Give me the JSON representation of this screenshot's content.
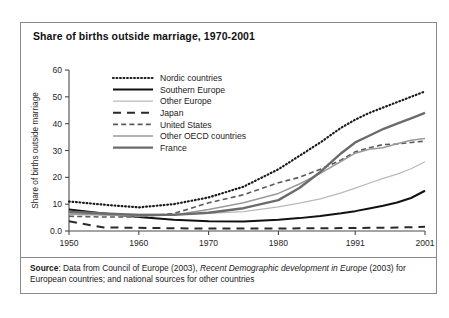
{
  "figure": {
    "title": "Share of births outside marriage, 1970-2001",
    "source_prefix": "Source",
    "source_text_1": ": Data from Council of Europe (2003), ",
    "source_italic": "Recent Demographic development in Europe",
    "source_text_2": " (2003) for European countries; and national sources for other countries"
  },
  "chart_data": {
    "type": "line",
    "title": "Share of births outside marriage, 1970-2001",
    "xlabel": "",
    "ylabel": "Share of births outside marriage",
    "xlim": [
      1950,
      2001
    ],
    "ylim": [
      0,
      60
    ],
    "ytick_labels": [
      "0.0",
      "10",
      "20",
      "30",
      "40",
      "50",
      "60"
    ],
    "ytick_values": [
      0,
      10,
      20,
      30,
      40,
      50,
      60
    ],
    "xtick_labels": [
      "1950",
      "1960",
      "1970",
      "1980",
      "1991",
      "2001"
    ],
    "xtick_values": [
      1950,
      1960,
      1970,
      1980,
      1991,
      2001
    ],
    "grid": false,
    "legend_position": "upper-left-inside",
    "x": [
      1950,
      1955,
      1960,
      1965,
      1970,
      1975,
      1980,
      1983,
      1986,
      1989,
      1991,
      1993,
      1995,
      1997,
      1999,
      2001
    ],
    "series": [
      {
        "name": "Nordic countries",
        "style": "dotted",
        "color": "#1a1a1a",
        "width": 2.2,
        "values": [
          11.0,
          9.8,
          8.8,
          10.0,
          12.5,
          16.5,
          23.0,
          28.0,
          33.0,
          38.5,
          41.5,
          44.0,
          46.0,
          48.0,
          50.0,
          52.0
        ]
      },
      {
        "name": "Southern Europe",
        "style": "solid",
        "color": "#111111",
        "width": 2.0,
        "values": [
          8.0,
          6.5,
          5.2,
          4.2,
          3.6,
          3.5,
          4.2,
          4.8,
          5.6,
          6.6,
          7.4,
          8.4,
          9.4,
          10.6,
          12.3,
          15.0
        ]
      },
      {
        "name": "Other Europe",
        "style": "solid",
        "color": "#b9b9b9",
        "width": 1.2,
        "values": [
          6.5,
          6.3,
          6.2,
          6.3,
          6.6,
          7.2,
          9.0,
          10.4,
          12.0,
          14.2,
          16.0,
          17.8,
          19.6,
          21.2,
          23.2,
          25.8
        ]
      },
      {
        "name": "Japan",
        "style": "longdash",
        "color": "#2a2a2a",
        "width": 2.0,
        "values": [
          3.6,
          1.3,
          1.2,
          1.0,
          0.9,
          0.9,
          0.9,
          1.0,
          1.0,
          1.1,
          1.1,
          1.2,
          1.2,
          1.3,
          1.4,
          1.6
        ]
      },
      {
        "name": "United States",
        "style": "dashed",
        "color": "#5a5a5a",
        "width": 1.6,
        "values": [
          5.5,
          5.2,
          5.3,
          6.5,
          10.5,
          13.5,
          18.0,
          20.0,
          23.0,
          26.5,
          29.5,
          31.0,
          32.2,
          32.4,
          33.0,
          33.5
        ]
      },
      {
        "name": "Other OECD countries",
        "style": "solid",
        "color": "#9a9a9a",
        "width": 1.5,
        "values": [
          6.2,
          6.0,
          5.6,
          6.0,
          8.0,
          10.5,
          14.0,
          17.5,
          21.5,
          26.0,
          29.0,
          30.5,
          31.0,
          32.5,
          33.8,
          34.5
        ]
      },
      {
        "name": "France",
        "style": "solid",
        "color": "#6b6b6b",
        "width": 2.4,
        "values": [
          7.2,
          6.5,
          6.0,
          6.0,
          6.8,
          8.5,
          11.5,
          16.0,
          22.0,
          29.0,
          33.0,
          35.5,
          38.0,
          40.0,
          42.0,
          44.0
        ]
      }
    ]
  },
  "legend": {
    "items": [
      {
        "label": "Nordic countries"
      },
      {
        "label": "Southern Europe"
      },
      {
        "label": "Other Europe"
      },
      {
        "label": "Japan"
      },
      {
        "label": "United States"
      },
      {
        "label": "Other OECD countries"
      },
      {
        "label": "France"
      }
    ]
  }
}
